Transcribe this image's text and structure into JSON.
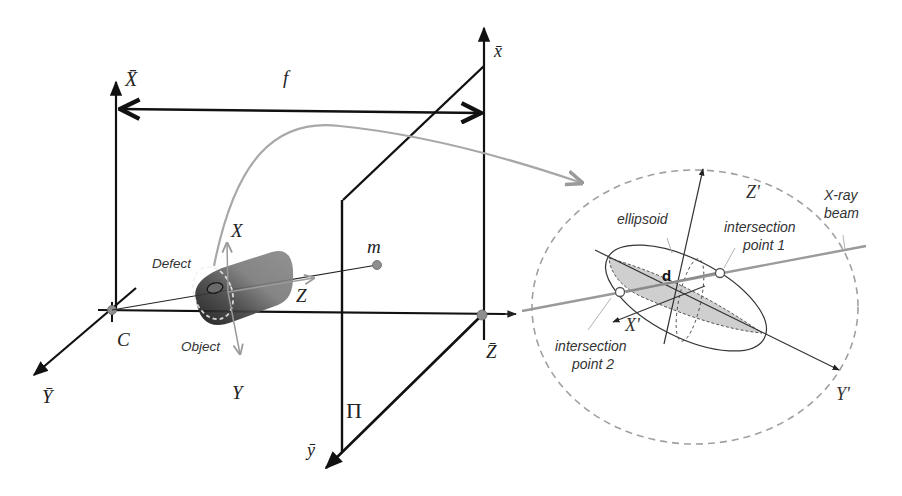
{
  "diagram": {
    "type": "3d-projection-geometry",
    "labels": {
      "X_bar": "X̄",
      "Y_bar": "Ȳ",
      "Z_bar": "Z̄",
      "x_bar": "x̄",
      "y_bar": "ȳ",
      "f": "f",
      "C": "C",
      "m": "m",
      "X": "X",
      "Y": "Y",
      "Z": "Z",
      "Pi": "Π",
      "defect": "Defect",
      "object": "Object",
      "X_prime": "X'",
      "Y_prime": "Y'",
      "Z_prime": "Z'",
      "ellipsoid": "ellipsoid",
      "xray_line1": "X-ray",
      "xray_line2": "beam",
      "ip1_line1": "intersection",
      "ip1_line2": "point 1",
      "ip2_line1": "intersection",
      "ip2_line2": "point 2",
      "d": "d"
    },
    "colors": {
      "axis": "#111111",
      "grey_curve": "#a8a8a8",
      "beam": "#9a9a9a",
      "dashed_circle": "#a0a0a0",
      "ellipse_fill": "#cfcfcf",
      "object_dark": "#2a2a2a",
      "object_mid": "#7d7d7d",
      "point": "#8f8f8f"
    }
  }
}
